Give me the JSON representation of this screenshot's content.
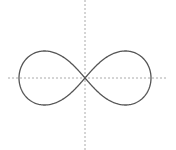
{
  "diagram": {
    "type": "lemniscate",
    "center": [
      85,
      78
    ],
    "half_width": 66,
    "half_height": 27,
    "colors": {
      "background": "#ffffff",
      "curve": "#555555",
      "axes": "#aaaaaa"
    },
    "axes": {
      "horizontal": {
        "x1": 8,
        "x2": 166,
        "y": 78,
        "dashed": true
      },
      "vertical": {
        "x": 85,
        "y1": 0,
        "y2": 150,
        "dashed": true
      }
    }
  }
}
